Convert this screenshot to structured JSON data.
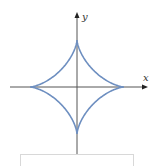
{
  "diagram": {
    "axes": {
      "x_label": "x",
      "y_label": "y",
      "axis_color": "#555555"
    },
    "curve": {
      "type": "astroid",
      "color": "#6e8fc0",
      "cusps": [
        "top",
        "right",
        "bottom",
        "left"
      ]
    }
  }
}
